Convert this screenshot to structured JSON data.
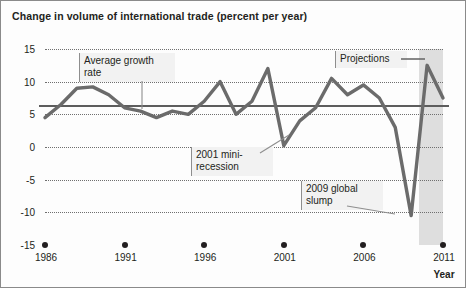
{
  "title": "Change in volume of international trade (percent per year)",
  "axis": {
    "x_title": "Year",
    "y_ticks": [
      "15",
      "10",
      "5",
      "0",
      "-5",
      "-10",
      "-15"
    ],
    "x_ticks": [
      "1986",
      "1991",
      "1996",
      "2001",
      "2006",
      "2011"
    ]
  },
  "annotations": {
    "average": "Average growth\nrate",
    "recession2001": "2001 mini-\nrecession",
    "slump2009": "2009 global\nslump",
    "projections": "Projections"
  },
  "colors": {
    "series": "#6b6b6b",
    "average": "#5d5d5d",
    "grid": "#6f6f6f",
    "projection_band": "#dcdcdc",
    "text": "#231f20",
    "frame": "#8a8a8a"
  },
  "chart_data": {
    "type": "line",
    "title": "Change in volume of international trade (percent per year)",
    "xlabel": "Year",
    "ylabel": "",
    "xlim": [
      1986,
      2011
    ],
    "ylim": [
      -15,
      15
    ],
    "grid": true,
    "legend": "none",
    "average_growth_rate": 6.5,
    "projection_start": 2010,
    "x": [
      1986,
      1987,
      1988,
      1989,
      1990,
      1991,
      1992,
      1993,
      1994,
      1995,
      1996,
      1997,
      1998,
      1999,
      2000,
      2001,
      2002,
      2003,
      2004,
      2005,
      2006,
      2007,
      2008,
      2009,
      2010,
      2011
    ],
    "series": [
      {
        "name": "Volume of international trade",
        "values": [
          4.5,
          6.5,
          9.0,
          9.2,
          8.0,
          6.0,
          5.5,
          4.5,
          5.5,
          5.0,
          7.0,
          10.0,
          5.0,
          7.0,
          12.0,
          0.2,
          4.0,
          6.0,
          10.5,
          8.0,
          9.5,
          7.5,
          3.0,
          -10.5,
          12.5,
          7.5
        ]
      }
    ],
    "annotations": [
      {
        "text": "Average growth rate",
        "target_x": 1996,
        "target_y": 6.5
      },
      {
        "text": "2001 mini-recession",
        "target_x": 2001,
        "target_y": 0.2
      },
      {
        "text": "2009 global slump",
        "target_x": 2009,
        "target_y": -10.5
      },
      {
        "text": "Projections",
        "target_x": 2010.5,
        "target_y": 13.0
      }
    ]
  }
}
